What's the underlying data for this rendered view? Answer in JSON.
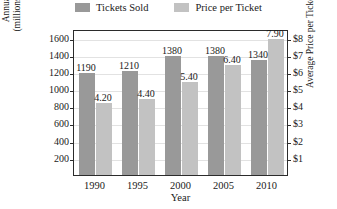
{
  "chart_data": {
    "type": "bar",
    "title": "",
    "xlabel": "Year",
    "ylabel": "Annual Admissions (millions of tickets sold)",
    "ylabel_line1": "Annual Admissions",
    "ylabel_line2": "(millions of tickets sold)",
    "y2label": "Average Price per Ticket",
    "categories": [
      "1990",
      "1995",
      "2000",
      "2005",
      "2010"
    ],
    "ylim": [
      0,
      1700
    ],
    "y2lim": [
      0,
      8.5
    ],
    "yticks": [
      200,
      400,
      600,
      800,
      1000,
      1200,
      1400,
      1600
    ],
    "ytick_labels": [
      "200",
      "400",
      "600",
      "800",
      "1000",
      "1200",
      "1400",
      "1600"
    ],
    "y2ticks": [
      1,
      2,
      3,
      4,
      5,
      6,
      7,
      8
    ],
    "y2tick_labels": [
      "$1",
      "$2",
      "$3",
      "$4",
      "$5",
      "$6",
      "$7",
      "$8"
    ],
    "grid": true,
    "legend_position": "top",
    "series": [
      {
        "name": "Tickets Sold",
        "axis": "left",
        "color": "#999999",
        "values": [
          1190,
          1210,
          1380,
          1380,
          1340
        ],
        "data_labels": [
          "1190",
          "1210",
          "1380",
          "1380",
          "1340"
        ]
      },
      {
        "name": "Price per Ticket",
        "axis": "right",
        "color": "#c2c2c2",
        "values": [
          4.2,
          4.4,
          5.4,
          6.4,
          7.9
        ],
        "data_labels": [
          "4.20",
          "4.40",
          "5.40",
          "6.40",
          "7.90"
        ]
      }
    ]
  },
  "legend": {
    "items": [
      {
        "label": "Tickets Sold",
        "color": "#999999"
      },
      {
        "label": "Price per Ticket",
        "color": "#c2c2c2"
      }
    ]
  }
}
